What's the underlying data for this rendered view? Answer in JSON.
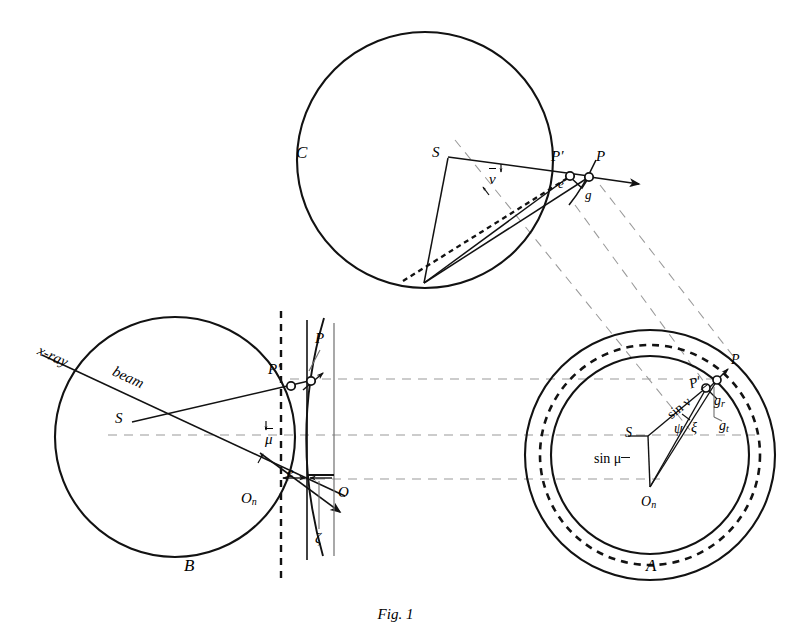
{
  "figure": {
    "caption": "Fig. 1",
    "panels": [
      {
        "id": "C",
        "label": "C",
        "x": 296,
        "y": 143
      },
      {
        "id": "B",
        "label": "B",
        "x": 184,
        "y": 566
      },
      {
        "id": "A",
        "label": "A",
        "x": 646,
        "y": 566
      }
    ]
  },
  "panelC": {
    "circle": {
      "cx": 425,
      "cy": 160,
      "r": 128
    },
    "points": [
      {
        "name": "S",
        "label": "S",
        "x": 448,
        "y": 155,
        "lx": 432,
        "ly": 148
      },
      {
        "name": "P-prime",
        "label": "P′",
        "x": 570,
        "y": 175,
        "lx": 553,
        "ly": 152
      },
      {
        "name": "P",
        "label": "P",
        "x": 589,
        "y": 176,
        "lx": 597,
        "ly": 152
      }
    ],
    "angle_labels": [
      {
        "name": "nu-bar",
        "text": "ν",
        "x": 494,
        "y": 175,
        "overbar": true
      },
      {
        "name": "e",
        "text": "e",
        "x": 562,
        "y": 182,
        "overbar": false
      },
      {
        "name": "g",
        "text": "g",
        "x": 588,
        "y": 192,
        "overbar": false
      }
    ]
  },
  "panelB": {
    "circle": {
      "cx": 175,
      "cy": 437,
      "r": 120
    },
    "beam_labels": [
      {
        "name": "x-ray",
        "text": "x-ray"
      },
      {
        "name": "beam",
        "text": "beam"
      }
    ],
    "points": [
      {
        "name": "S",
        "label": "S",
        "x": 131,
        "y": 421,
        "lx": 118,
        "ly": 414
      },
      {
        "name": "P-prime",
        "label": "P′",
        "x": 293,
        "y": 387,
        "lx": 273,
        "ly": 367
      },
      {
        "name": "P",
        "label": "P",
        "x": 312,
        "y": 380,
        "lx": 318,
        "ly": 338
      },
      {
        "name": "O",
        "label": "O",
        "x": 334,
        "y": 482,
        "lx": 340,
        "ly": 490
      },
      {
        "name": "O-n",
        "label": "O",
        "sub": "n",
        "x": 281,
        "y": 482,
        "lx": 243,
        "ly": 497
      }
    ],
    "angle_labels": [
      {
        "name": "mu-bar",
        "text": "μ",
        "x": 270,
        "y": 436,
        "overbar": true
      },
      {
        "name": "e",
        "text": "e",
        "x": 290,
        "y": 470,
        "overbar": false
      },
      {
        "name": "zeta",
        "text": "ζ",
        "x": 319,
        "y": 538,
        "overbar": false
      }
    ]
  },
  "panelA": {
    "circles": [
      {
        "name": "outer-circle",
        "cx": 650,
        "cy": 455,
        "r": 125,
        "dashed": false
      },
      {
        "name": "dashed-circle",
        "cx": 650,
        "cy": 455,
        "r": 110,
        "dashed": true
      },
      {
        "name": "inner-circle",
        "cx": 650,
        "cy": 455,
        "r": 99,
        "dashed": false
      }
    ],
    "points": [
      {
        "name": "S",
        "label": "S",
        "x": 648,
        "y": 435,
        "lx": 628,
        "ly": 427
      },
      {
        "name": "P-prime",
        "label": "P′",
        "x": 707,
        "y": 387,
        "lx": 691,
        "ly": 382
      },
      {
        "name": "P",
        "label": "P",
        "x": 718,
        "y": 379,
        "lx": 733,
        "ly": 357
      },
      {
        "name": "O-n",
        "label": "O",
        "sub": "n",
        "x": 650,
        "y": 487,
        "lx": 645,
        "ly": 504
      }
    ],
    "segment_labels": [
      {
        "name": "sin-nu-bar",
        "text": "sin ν",
        "overbar": true,
        "x": 672,
        "y": 413,
        "rot": -38
      },
      {
        "name": "sin-mu-bar",
        "text": "sin μ",
        "overbar": true,
        "x": 608,
        "y": 460,
        "rot": 0
      }
    ],
    "angle_labels": [
      {
        "name": "psi",
        "text": "ψ",
        "x": 679,
        "y": 428
      },
      {
        "name": "xi",
        "text": "ξ",
        "x": 695,
        "y": 427
      }
    ],
    "vector_labels": [
      {
        "name": "g-r",
        "text": "g",
        "sub": "r",
        "x": 717,
        "y": 401
      },
      {
        "name": "g-t",
        "text": "g",
        "sub": "t",
        "x": 722,
        "y": 426
      }
    ]
  },
  "colors": {
    "ink": "#121212",
    "guide_gray": "#9a9a9a",
    "background": "#ffffff"
  }
}
